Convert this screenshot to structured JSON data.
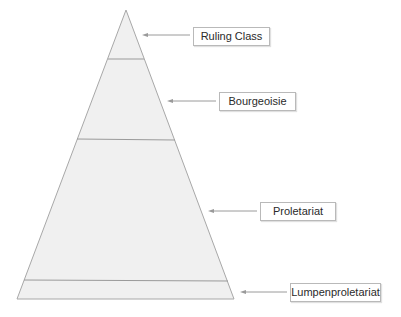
{
  "diagram": {
    "type": "pyramid",
    "colors": {
      "fill": "#f0f0f0",
      "stroke": "#a8a8a8",
      "divider": "#9a9a9a",
      "arrow": "#9a9a9a",
      "label_border": "#b9b9b9"
    },
    "layers": [
      {
        "id": "ruling-class",
        "label": "Ruling Class"
      },
      {
        "id": "bourgeoisie",
        "label": "Bourgeoisie"
      },
      {
        "id": "proletariat",
        "label": "Proletariat"
      },
      {
        "id": "lumpenproletariat",
        "label": "Lumpenproletariat"
      }
    ]
  }
}
